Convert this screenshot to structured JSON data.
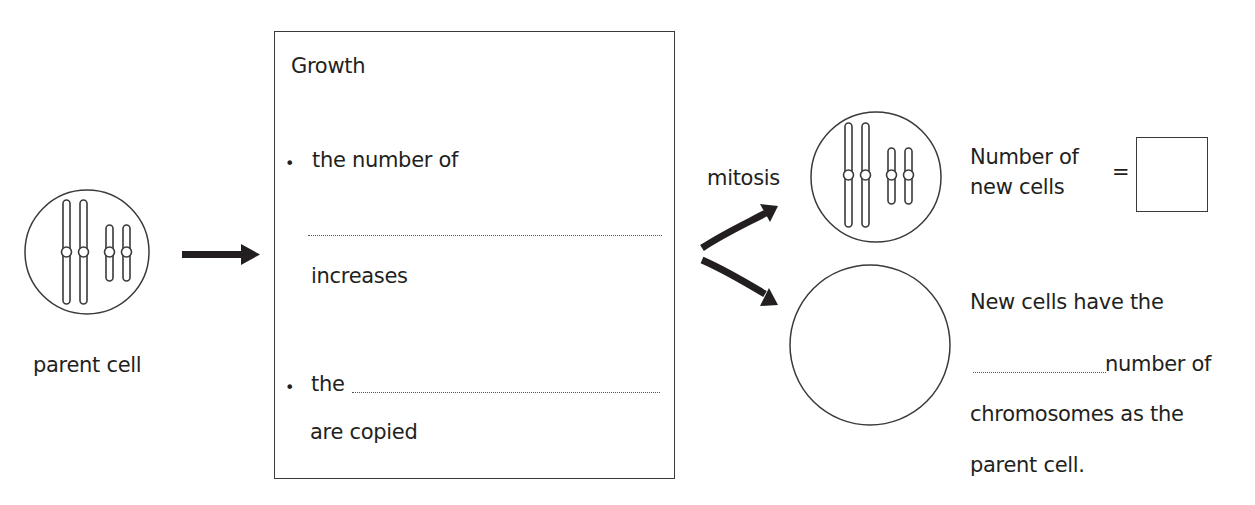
{
  "diagram": {
    "parent_cell": {
      "label": "parent cell",
      "chromosomes": "2 long + 2 short chromosomes"
    },
    "growth_box": {
      "heading": "Growth",
      "bullets": [
        {
          "marker": "•",
          "before": "the number of",
          "blank": "",
          "after": "increases"
        },
        {
          "marker": "•",
          "before": "the",
          "blank": "",
          "after": "are copied"
        }
      ]
    },
    "process_label": "mitosis",
    "new_cells": {
      "count_label_line1": "Number of",
      "count_label_line2": "new cells",
      "equals": "=",
      "count_answer": "",
      "statement_line1": "New cells have the",
      "statement_line2_suffix": "number of",
      "statement_line3": "chromosomes as the",
      "statement_line4": "parent cell.",
      "blank_answer": ""
    },
    "colors": {
      "ink": "#231f20",
      "border": "#3a3a3a",
      "background": "#ffffff"
    }
  }
}
